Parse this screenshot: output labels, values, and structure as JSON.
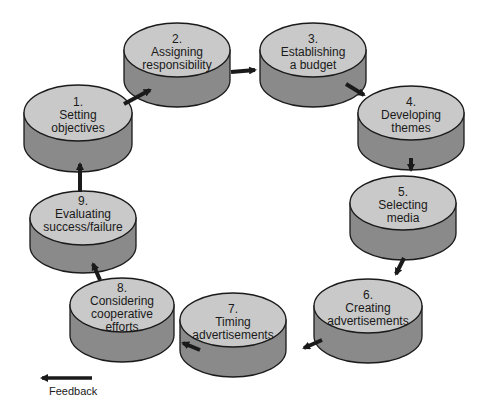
{
  "diagram": {
    "type": "cycle-flow",
    "colors": {
      "top": "#c9c9c9",
      "side": "#8a8a8a",
      "stroke": "#1a1a1a",
      "arrow": "#1a1a1a",
      "background": "#ffffff"
    },
    "nodes": [
      {
        "id": 1,
        "number": "1.",
        "line1": "Setting",
        "line2": "objectives"
      },
      {
        "id": 2,
        "number": "2.",
        "line1": "Assigning",
        "line2": "responsibility"
      },
      {
        "id": 3,
        "number": "3.",
        "line1": "Establishing",
        "line2": "a budget"
      },
      {
        "id": 4,
        "number": "4.",
        "line1": "Developing",
        "line2": "themes"
      },
      {
        "id": 5,
        "number": "5.",
        "line1": "Selecting",
        "line2": "media"
      },
      {
        "id": 6,
        "number": "6.",
        "line1": "Creating",
        "line2": "advertisements"
      },
      {
        "id": 7,
        "number": "7.",
        "line1": "Timing",
        "line2": "advertisements"
      },
      {
        "id": 8,
        "number": "8.",
        "line1": "Considering",
        "line2": "cooperative",
        "line3": "efforts"
      },
      {
        "id": 9,
        "number": "9.",
        "line1": "Evaluating",
        "line2": "success/failure"
      }
    ],
    "edges": [
      {
        "from": 1,
        "to": 2
      },
      {
        "from": 2,
        "to": 3
      },
      {
        "from": 3,
        "to": 4
      },
      {
        "from": 4,
        "to": 5
      },
      {
        "from": 5,
        "to": 6
      },
      {
        "from": 6,
        "to": 7
      },
      {
        "from": 7,
        "to": 8
      },
      {
        "from": 8,
        "to": 9
      },
      {
        "from": 9,
        "to": 1
      }
    ],
    "legend": {
      "arrow_label": "Feedback"
    }
  }
}
